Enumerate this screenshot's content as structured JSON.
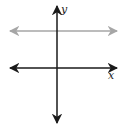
{
  "diagram": {
    "type": "coordinate-plane",
    "axes": {
      "x_label": "x",
      "y_label": "y",
      "color": "#1a1a1a"
    },
    "horizontal_line": {
      "description": "horizontal line above the x-axis (y = c, c > 0)",
      "color": "#a6a6a6",
      "arrows": "both ends"
    }
  }
}
